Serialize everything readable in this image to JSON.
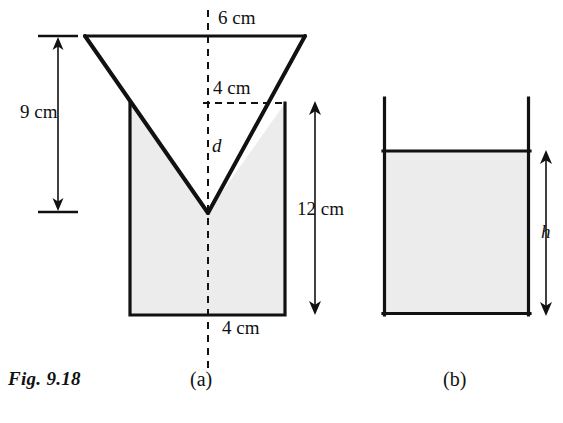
{
  "figure": {
    "caption": "Fig. 9.18",
    "subfigures": [
      {
        "id": "a",
        "label": "(a)"
      },
      {
        "id": "b",
        "label": "(b)"
      }
    ]
  },
  "diagram_a": {
    "name": "funnel-with-liquid",
    "dimensions": [
      {
        "name": "top-width",
        "text": "6 cm",
        "value": 6,
        "unit": "cm"
      },
      {
        "name": "cone-height",
        "text": "9 cm",
        "value": 9,
        "unit": "cm"
      },
      {
        "name": "inner-width",
        "text": "4 cm",
        "value": 4,
        "unit": "cm"
      },
      {
        "name": "vessel-height",
        "text": "12 cm",
        "value": 12,
        "unit": "cm"
      },
      {
        "name": "base-width",
        "text": "4 cm",
        "value": 4,
        "unit": "cm"
      }
    ],
    "variables": [
      {
        "name": "depth-variable",
        "text": "d"
      }
    ]
  },
  "diagram_b": {
    "name": "container-with-liquid",
    "variables": [
      {
        "name": "height-variable",
        "text": "h"
      }
    ]
  },
  "colors": {
    "line": "#111111",
    "fill": "#ececec",
    "background": "#ffffff"
  }
}
